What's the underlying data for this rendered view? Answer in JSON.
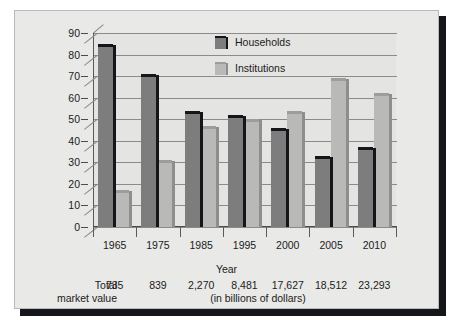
{
  "chart_data": {
    "type": "bar",
    "title": "",
    "xlabel": "Year",
    "ylabel": "",
    "ylim": [
      0,
      90
    ],
    "yticks": [
      0,
      10,
      20,
      30,
      40,
      50,
      60,
      70,
      80,
      90
    ],
    "grid": true,
    "legend_position": "top-center",
    "categories": [
      "1965",
      "1975",
      "1985",
      "1995",
      "2000",
      "2005",
      "2010"
    ],
    "series": [
      {
        "name": "Households",
        "color": "#7d7d7d",
        "values": [
          85,
          71,
          54,
          52,
          46,
          33,
          37
        ]
      },
      {
        "name": "Institutions",
        "color": "#b9b9b7",
        "values": [
          17,
          31,
          47,
          50,
          54,
          69,
          62
        ]
      }
    ],
    "annotations": {
      "total_market_value_label_line1": "Total",
      "total_market_value_label_line2": "market value",
      "total_market_values": [
        "735",
        "839",
        "2,270",
        "8,481",
        "17,627",
        "18,512",
        "23,293"
      ],
      "units": "(in billions of dollars)"
    }
  },
  "legend": {
    "items": [
      {
        "label": "Households",
        "swatch": "dark-gray-swatch"
      },
      {
        "label": "Institutions",
        "swatch": "light-gray-swatch"
      }
    ]
  },
  "axis": {
    "x_title": "Year",
    "y_tick_labels": [
      "90",
      "80",
      "70",
      "60",
      "50",
      "40",
      "30",
      "20",
      "10",
      "0"
    ],
    "x_tick_labels": [
      "1965",
      "1975",
      "1985",
      "1995",
      "2000",
      "2005",
      "2010"
    ]
  },
  "totals": {
    "label_line1": "Total",
    "label_line2": "market value",
    "values": [
      "735",
      "839",
      "2,270",
      "8,481",
      "17,627",
      "18,512",
      "23,293"
    ],
    "units": "(in billions of dollars)"
  },
  "colors": {
    "households": "#7d7d7d",
    "institutions": "#b9b9b7",
    "panel_background": "#e9e9e7",
    "frame_shadow": "#14161a",
    "gridline": "#8b8b8d"
  }
}
